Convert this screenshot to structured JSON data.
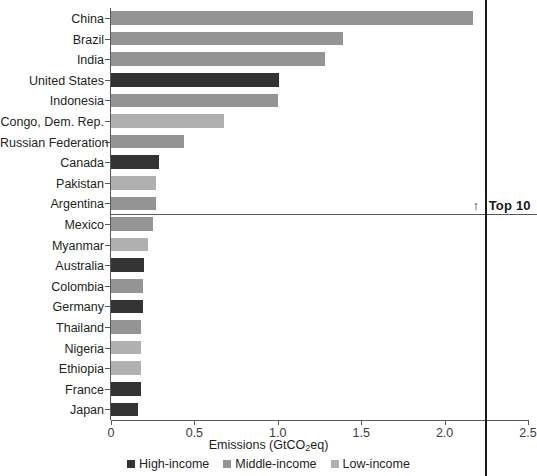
{
  "chart_data": {
    "type": "bar",
    "orientation": "horizontal",
    "title": "",
    "xlabel": "Emissions (GtCO2eq)",
    "xlabel_parts": {
      "pre": "Emissions (GtCO",
      "sub": "2",
      "post": "eq)"
    },
    "ylabel": "",
    "xlim": [
      0,
      2.5
    ],
    "xticks": [
      0,
      0.5,
      1.0,
      1.5,
      2.0,
      2.5
    ],
    "xtick_labels": [
      "0",
      "0.5",
      "1.0",
      "1.5",
      "2.0",
      "2.5"
    ],
    "grid": false,
    "legend_position": "bottom",
    "categories": [
      "China",
      "Brazil",
      "India",
      "United States",
      "Indonesia",
      "Congo, Dem. Rep.",
      "Russian Federation",
      "Canada",
      "Pakistan",
      "Argentina",
      "Mexico",
      "Myanmar",
      "Australia",
      "Colombia",
      "Germany",
      "Thailand",
      "Nigeria",
      "Ethiopia",
      "France",
      "Japan"
    ],
    "values": [
      2.17,
      1.39,
      1.28,
      1.01,
      1.0,
      0.68,
      0.44,
      0.29,
      0.27,
      0.27,
      0.25,
      0.22,
      0.2,
      0.19,
      0.19,
      0.18,
      0.18,
      0.18,
      0.18,
      0.16
    ],
    "groups": [
      "middle",
      "middle",
      "middle",
      "high",
      "middle",
      "low",
      "middle",
      "high",
      "low",
      "middle",
      "middle",
      "low",
      "high",
      "middle",
      "high",
      "middle",
      "low",
      "low",
      "high",
      "high"
    ],
    "series": [
      {
        "name": "Emissions",
        "values": [
          2.17,
          1.39,
          1.28,
          1.01,
          1.0,
          0.68,
          0.44,
          0.29,
          0.27,
          0.27,
          0.25,
          0.22,
          0.2,
          0.19,
          0.19,
          0.18,
          0.18,
          0.18,
          0.18,
          0.16
        ]
      }
    ],
    "annotations": [
      {
        "name": "top-10-divider",
        "label": "Top 10",
        "arrow": "↑",
        "after_category_index": 9
      },
      {
        "name": "reference-line",
        "value": 2.24
      }
    ],
    "legend": [
      {
        "label": "High-income",
        "key": "high",
        "color": "#333333"
      },
      {
        "label": "Middle-income",
        "key": "middle",
        "color": "#949494"
      },
      {
        "label": "Low-income",
        "key": "low",
        "color": "#b0b0b0"
      }
    ]
  },
  "colors": {
    "high_income": "#333333",
    "middle_income": "#949494",
    "low_income": "#b0b0b0",
    "axis": "#58595b",
    "reference_line": "#1a1a1a",
    "text": "#231f20"
  }
}
